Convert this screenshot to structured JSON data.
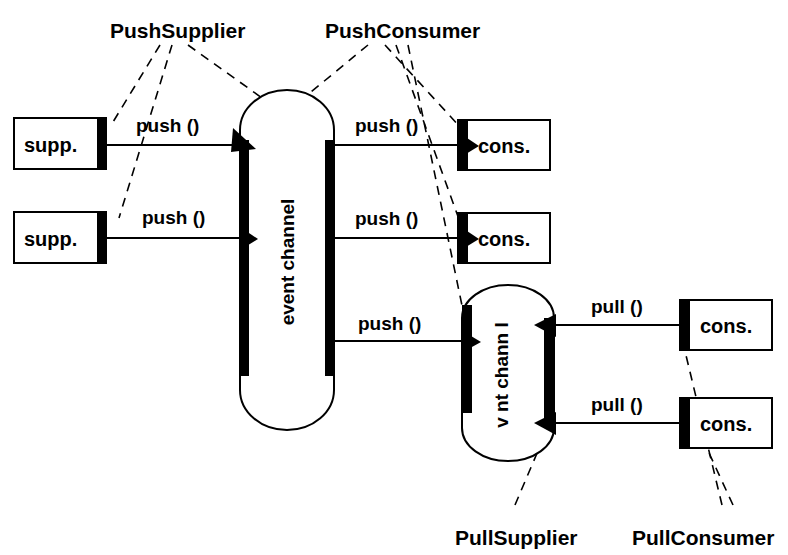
{
  "diagram": {
    "background_color": "#ffffff",
    "ink_color": "#000000",
    "roles": {
      "push_supplier": "PushSupplier",
      "push_consumer": "PushConsumer",
      "pull_supplier": "PullSupplier",
      "pull_consumer": "PullConsumer"
    },
    "channels": {
      "push_channel_label": "event channel",
      "pull_channel_label": "v nt chann l"
    },
    "suppliers": [
      {
        "label": "supp."
      },
      {
        "label": "supp."
      }
    ],
    "push_consumers": [
      {
        "label": "cons."
      },
      {
        "label": "cons."
      }
    ],
    "pull_consumers": [
      {
        "label": "cons."
      },
      {
        "label": "cons."
      }
    ],
    "operations": {
      "push_supp_1": "push ()",
      "push_supp_2": "push ()",
      "push_cons_1": "push ()",
      "push_cons_2": "push ()",
      "push_cons_3": "push ()",
      "pull_1": "pull ()",
      "pull_2": "pull ()"
    }
  }
}
